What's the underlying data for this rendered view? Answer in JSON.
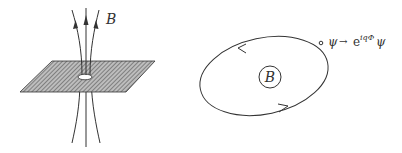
{
  "figure": {
    "left_panel": {
      "description": "Magnetic flux tube piercing a hatched plane through a small hole",
      "field_label": "B",
      "field_lines": 3,
      "arrow_direction": "up"
    },
    "right_panel": {
      "description": "Closed loop around enclosed magnetic field, with orientation arrows",
      "enclosed_label": "B",
      "transformation_label": {
        "lhs": "ψ",
        "arrow": "→",
        "base": "e",
        "exponent": "iqΦ",
        "rhs": "ψ"
      },
      "loop_direction": "counterclockwise"
    },
    "colors": {
      "line": "#333333",
      "hatch": "#555555",
      "background": "#ffffff"
    }
  }
}
